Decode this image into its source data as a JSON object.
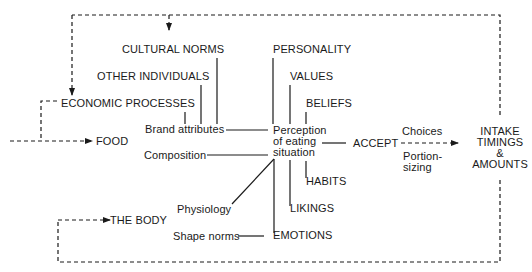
{
  "diagram": {
    "title": "",
    "nodes": {
      "cultural_norms": "CULTURAL NORMS",
      "other_individuals": "OTHER INDIVIDUALS",
      "economic_processes": "ECONOMIC PROCESSES",
      "brand_attributes": "Brand attributes",
      "food": "FOOD",
      "composition": "Composition",
      "physiology": "Physiology",
      "the_body": "THE BODY",
      "shape_norms": "Shape norms",
      "personality": "PERSONALITY",
      "values": "VALUES",
      "beliefs": "BELIEFS",
      "perception": [
        "Perception",
        "of eating",
        "situation"
      ],
      "habits": "HABITS",
      "likings": "LIKINGS",
      "emotions": "EMOTIONS",
      "accept": "ACCEPT",
      "choices": "Choices",
      "portion_sizing": [
        "Portion-",
        "sizing"
      ],
      "intake": [
        "INTAKE",
        "TIMINGS",
        "&",
        "AMOUNTS"
      ]
    },
    "edges": [
      {
        "from": "cultural_norms",
        "to": "brand_attributes",
        "style": "solid"
      },
      {
        "from": "other_individuals",
        "to": "brand_attributes",
        "style": "solid"
      },
      {
        "from": "economic_processes",
        "to": "brand_attributes",
        "style": "solid"
      },
      {
        "from": "brand_attributes",
        "to": "perception",
        "style": "solid"
      },
      {
        "from": "composition",
        "to": "perception",
        "style": "solid"
      },
      {
        "from": "physiology",
        "to": "perception",
        "style": "solid"
      },
      {
        "from": "shape_norms",
        "to": "emotions",
        "style": "solid"
      },
      {
        "from": "emotions",
        "to": "perception",
        "style": "solid"
      },
      {
        "from": "likings",
        "to": "perception",
        "style": "solid"
      },
      {
        "from": "habits",
        "to": "perception",
        "style": "solid"
      },
      {
        "from": "personality",
        "to": "perception",
        "style": "solid"
      },
      {
        "from": "values",
        "to": "perception",
        "style": "solid"
      },
      {
        "from": "beliefs",
        "to": "perception",
        "style": "solid"
      },
      {
        "from": "perception",
        "to": "accept",
        "style": "solid"
      },
      {
        "from": "accept",
        "to": "intake",
        "style": "dashed-arrow"
      },
      {
        "from": "intake",
        "to": "cultural_norms",
        "style": "dashed-arrow"
      },
      {
        "from": "intake",
        "to": "economic_processes",
        "style": "dashed-arrow"
      },
      {
        "from": "intake",
        "to": "the_body",
        "style": "dashed-arrow"
      },
      {
        "from": "economic_processes",
        "to": "food",
        "style": "dashed-arrow"
      },
      {
        "from": "external",
        "to": "food",
        "style": "dashed-arrow"
      }
    ],
    "colors": {
      "line": "#1a1a1a",
      "text": "#1a1a1a",
      "background": "#ffffff"
    }
  }
}
